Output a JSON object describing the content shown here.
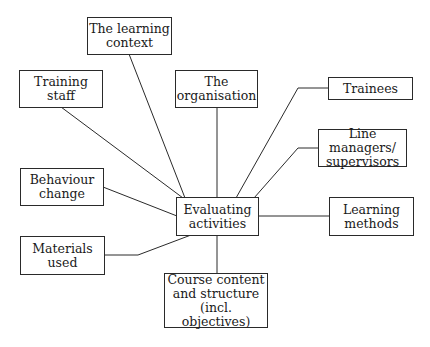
{
  "diagram": {
    "type": "hub-and-spoke",
    "center": {
      "id": "evaluating",
      "label": "Evaluating\nactivities"
    },
    "nodes": [
      {
        "id": "learning-context",
        "label": "The learning\ncontext"
      },
      {
        "id": "training-staff",
        "label": "Training\nstaff"
      },
      {
        "id": "organisation",
        "label": "The\norganisation"
      },
      {
        "id": "trainees",
        "label": "Trainees"
      },
      {
        "id": "line-managers",
        "label": "Line managers/\nsupervisors"
      },
      {
        "id": "behaviour-change",
        "label": "Behaviour\nchange"
      },
      {
        "id": "learning-methods",
        "label": "Learning\nmethods"
      },
      {
        "id": "materials-used",
        "label": "Materials\nused"
      },
      {
        "id": "course-content",
        "label": "Course content\nand structure\n(incl. objectives)"
      }
    ],
    "edges": [
      {
        "from": "learning-context",
        "to": "evaluating"
      },
      {
        "from": "training-staff",
        "to": "evaluating"
      },
      {
        "from": "organisation",
        "to": "evaluating"
      },
      {
        "from": "trainees",
        "to": "evaluating"
      },
      {
        "from": "line-managers",
        "to": "evaluating"
      },
      {
        "from": "behaviour-change",
        "to": "evaluating"
      },
      {
        "from": "learning-methods",
        "to": "evaluating"
      },
      {
        "from": "materials-used",
        "to": "evaluating"
      },
      {
        "from": "course-content",
        "to": "evaluating"
      }
    ]
  }
}
